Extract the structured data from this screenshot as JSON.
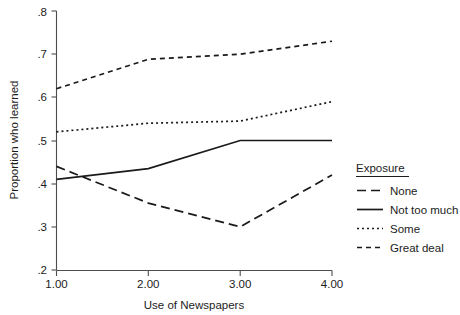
{
  "chart_data": {
    "type": "line",
    "title": "",
    "xlabel": "Use of Newspapers",
    "ylabel": "Proportion who learned",
    "x": [
      1.0,
      2.0,
      3.0,
      4.0
    ],
    "xtick_labels": [
      "1.00",
      "2.00",
      "3.00",
      "4.00"
    ],
    "xlim": [
      1.0,
      4.0
    ],
    "ylim": [
      0.2,
      0.8
    ],
    "ytick_values": [
      0.2,
      0.3,
      0.4,
      0.5,
      0.6,
      0.7,
      0.8
    ],
    "ytick_labels": [
      ".2",
      ".3",
      ".4",
      ".5",
      ".6",
      ".7",
      ".8"
    ],
    "grid": false,
    "legend_position": "right",
    "legend_title": "Exposure",
    "series": [
      {
        "name": "None",
        "style": "long-dash",
        "dasharray": "9,5",
        "values": [
          0.44,
          0.355,
          0.3,
          0.42
        ]
      },
      {
        "name": "Not too much",
        "style": "solid",
        "dasharray": "none",
        "values": [
          0.41,
          0.435,
          0.5,
          0.5
        ]
      },
      {
        "name": "Some",
        "style": "dotted",
        "dasharray": "2,3",
        "values": [
          0.52,
          0.54,
          0.545,
          0.59
        ]
      },
      {
        "name": "Great deal",
        "style": "short-dash",
        "dasharray": "5,4",
        "values": [
          0.62,
          0.688,
          0.7,
          0.73
        ]
      }
    ]
  },
  "axes": {
    "ylabel": "Proportion who learned",
    "xlabel": "Use of Newspapers",
    "ytick_0": ".2",
    "ytick_1": ".3",
    "ytick_2": ".4",
    "ytick_3": ".5",
    "ytick_4": ".6",
    "ytick_5": ".7",
    "ytick_6": ".8",
    "xtick_0": "1.00",
    "xtick_1": "2.00",
    "xtick_2": "3.00",
    "xtick_3": "4.00"
  },
  "legend": {
    "title": "Exposure",
    "items": [
      {
        "label": "None"
      },
      {
        "label": "Not too much"
      },
      {
        "label": "Some"
      },
      {
        "label": "Great deal"
      }
    ]
  },
  "colors": {
    "line": "#1a1a1a",
    "axis": "#4d4d4d",
    "text": "#1c1c1c",
    "background": "#ffffff"
  }
}
